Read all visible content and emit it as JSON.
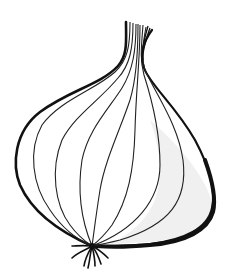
{
  "image": {
    "subject": "onion",
    "style": "black line-art illustration",
    "alt": "Line drawing of an onion bulb with a narrow neck at top and a root tuft at the bottom"
  },
  "colors": {
    "background": "#ffffff",
    "stroke": "#111111",
    "shade": "#efefef"
  }
}
